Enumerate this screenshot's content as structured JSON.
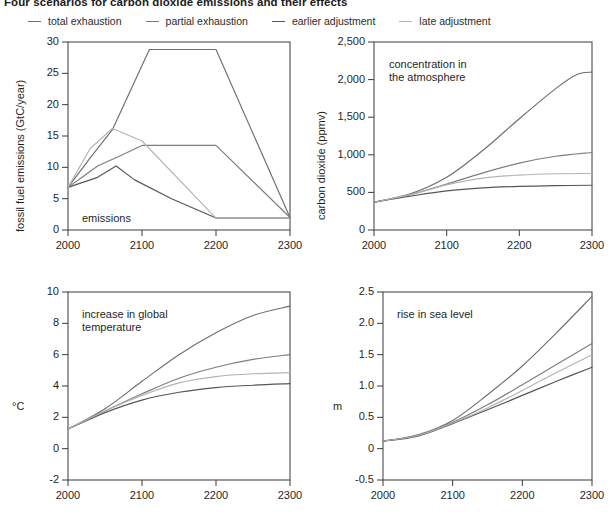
{
  "figure": {
    "title": "Four scenarios for carbon dioxide emissions and their effects",
    "background": "#ffffff",
    "width": 615,
    "height": 524
  },
  "legend": {
    "position": "top",
    "items": [
      {
        "label": "total exhaustion",
        "color": "#6e6e6e",
        "swatch": "line-swatch"
      },
      {
        "label": "partial exhaustion",
        "color": "#7d7d7d",
        "swatch": "line-swatch"
      },
      {
        "label": "earlier adjustment",
        "color": "#565656",
        "swatch": "line-swatch"
      },
      {
        "label": "late adjustment",
        "color": "#b4b4b4",
        "swatch": "line-swatch"
      }
    ]
  },
  "chart_data": [
    {
      "id": "emissions",
      "type": "line",
      "title": "emissions",
      "xlabel": "",
      "ylabel": "fossil fuel emissions (GtC/year)",
      "xlim": [
        2000,
        2300
      ],
      "ylim": [
        0,
        30
      ],
      "xticks": [
        2000,
        2100,
        2200,
        2300
      ],
      "xticklabels": [
        "2000",
        "2100",
        "2200",
        "2300"
      ],
      "yticks": [
        0,
        5,
        10,
        15,
        20,
        25,
        30
      ],
      "yticklabels": [
        "0",
        "5",
        "10",
        "15",
        "20",
        "25",
        "30"
      ],
      "grid": false,
      "legend_position": "figure-top",
      "series": [
        {
          "name": "total exhaustion",
          "color": "#6e6e6e",
          "x": [
            2000,
            2030,
            2060,
            2110,
            2200,
            2300
          ],
          "y": [
            6.8,
            11.5,
            16.0,
            28.8,
            28.8,
            2.0
          ]
        },
        {
          "name": "partial exhaustion",
          "color": "#7d7d7d",
          "x": [
            2000,
            2020,
            2040,
            2070,
            2100,
            2200,
            2300
          ],
          "y": [
            6.8,
            8.5,
            10.2,
            11.8,
            13.5,
            13.5,
            2.0
          ]
        },
        {
          "name": "earlier adjustment",
          "color": "#565656",
          "x": [
            2000,
            2020,
            2040,
            2065,
            2090,
            2140,
            2200,
            2300
          ],
          "y": [
            6.8,
            7.6,
            8.4,
            10.2,
            8.0,
            5.0,
            1.9,
            1.9
          ]
        },
        {
          "name": "late adjustment",
          "color": "#b4b4b4",
          "x": [
            2000,
            2030,
            2060,
            2100,
            2200,
            2300
          ],
          "y": [
            6.8,
            13.0,
            16.2,
            14.2,
            1.9,
            1.9
          ]
        }
      ]
    },
    {
      "id": "concentration",
      "type": "line",
      "title": "concentration in\nthe atmosphere",
      "xlabel": "",
      "ylabel": "carbon dioxide (ppmv)",
      "xlim": [
        2000,
        2300
      ],
      "ylim": [
        0,
        2500
      ],
      "xticks": [
        2000,
        2100,
        2200,
        2300
      ],
      "xticklabels": [
        "2000",
        "2100",
        "2200",
        "2300"
      ],
      "yticks": [
        0,
        500,
        1000,
        1500,
        2000,
        2500
      ],
      "yticklabels": [
        "0",
        "500",
        "1,000",
        "1,500",
        "2,000",
        "2,500"
      ],
      "grid": false,
      "series": [
        {
          "name": "total exhaustion",
          "color": "#6e6e6e",
          "x": [
            2000,
            2050,
            2100,
            2150,
            2200,
            2250,
            2280,
            2300
          ],
          "y": [
            370,
            480,
            700,
            1060,
            1480,
            1880,
            2070,
            2100
          ]
        },
        {
          "name": "partial exhaustion",
          "color": "#7d7d7d",
          "x": [
            2000,
            2050,
            2100,
            2150,
            2200,
            2250,
            2300
          ],
          "y": [
            370,
            470,
            610,
            760,
            890,
            980,
            1030
          ]
        },
        {
          "name": "earlier adjustment",
          "color": "#565656",
          "x": [
            2000,
            2050,
            2100,
            2150,
            2200,
            2250,
            2300
          ],
          "y": [
            370,
            450,
            520,
            560,
            580,
            590,
            595
          ]
        },
        {
          "name": "late adjustment",
          "color": "#b4b4b4",
          "x": [
            2000,
            2050,
            2100,
            2150,
            2200,
            2250,
            2300
          ],
          "y": [
            370,
            470,
            600,
            690,
            730,
            748,
            752
          ]
        }
      ]
    },
    {
      "id": "temperature",
      "type": "line",
      "title": "increase in global\ntemperature",
      "xlabel": "",
      "ylabel": "°C",
      "xlim": [
        2000,
        2300
      ],
      "ylim": [
        -2,
        10
      ],
      "xticks": [
        2000,
        2100,
        2200,
        2300
      ],
      "xticklabels": [
        "2000",
        "2100",
        "2200",
        "2300"
      ],
      "yticks": [
        -2,
        0,
        2,
        4,
        6,
        8,
        10
      ],
      "yticklabels": [
        "-2",
        "0",
        "2",
        "4",
        "6",
        "8",
        "10"
      ],
      "grid": false,
      "series": [
        {
          "name": "total exhaustion",
          "color": "#6e6e6e",
          "x": [
            2000,
            2050,
            2100,
            2150,
            2200,
            2250,
            2300
          ],
          "y": [
            1.25,
            2.55,
            4.3,
            6.0,
            7.4,
            8.5,
            9.1
          ]
        },
        {
          "name": "partial exhaustion",
          "color": "#7d7d7d",
          "x": [
            2000,
            2050,
            2100,
            2150,
            2200,
            2250,
            2300
          ],
          "y": [
            1.25,
            2.4,
            3.5,
            4.5,
            5.2,
            5.7,
            6.0
          ]
        },
        {
          "name": "earlier adjustment",
          "color": "#565656",
          "x": [
            2000,
            2050,
            2100,
            2150,
            2200,
            2250,
            2300
          ],
          "y": [
            1.25,
            2.3,
            3.1,
            3.6,
            3.9,
            4.05,
            4.15
          ]
        },
        {
          "name": "late adjustment",
          "color": "#b4b4b4",
          "x": [
            2000,
            2050,
            2100,
            2150,
            2200,
            2250,
            2300
          ],
          "y": [
            1.25,
            2.4,
            3.4,
            4.2,
            4.6,
            4.78,
            4.85
          ]
        }
      ]
    },
    {
      "id": "sealevel",
      "type": "line",
      "title": "rise in sea level",
      "xlabel": "",
      "ylabel": "m",
      "xlim": [
        2000,
        2300
      ],
      "ylim": [
        -0.5,
        2.5
      ],
      "xticks": [
        2000,
        2100,
        2200,
        2300
      ],
      "xticklabels": [
        "2000",
        "2100",
        "2200",
        "2300"
      ],
      "yticks": [
        -0.5,
        0,
        0.5,
        1.0,
        1.5,
        2.0,
        2.5
      ],
      "yticklabels": [
        "-0.5",
        "0",
        "0.5",
        "1.0",
        "1.5",
        "2.0",
        "2.5"
      ],
      "grid": false,
      "series": [
        {
          "name": "total exhaustion",
          "color": "#6e6e6e",
          "x": [
            2000,
            2050,
            2100,
            2150,
            2200,
            2250,
            2300
          ],
          "y": [
            0.12,
            0.22,
            0.45,
            0.86,
            1.32,
            1.86,
            2.43
          ]
        },
        {
          "name": "partial exhaustion",
          "color": "#7d7d7d",
          "x": [
            2000,
            2050,
            2100,
            2150,
            2200,
            2250,
            2300
          ],
          "y": [
            0.12,
            0.21,
            0.42,
            0.7,
            1.02,
            1.35,
            1.68
          ]
        },
        {
          "name": "earlier adjustment",
          "color": "#565656",
          "x": [
            2000,
            2050,
            2100,
            2150,
            2200,
            2250,
            2300
          ],
          "y": [
            0.12,
            0.2,
            0.4,
            0.62,
            0.85,
            1.08,
            1.3
          ]
        },
        {
          "name": "late adjustment",
          "color": "#b4b4b4",
          "x": [
            2000,
            2050,
            2100,
            2150,
            2200,
            2250,
            2300
          ],
          "y": [
            0.12,
            0.21,
            0.41,
            0.65,
            0.93,
            1.22,
            1.5
          ]
        }
      ]
    }
  ]
}
